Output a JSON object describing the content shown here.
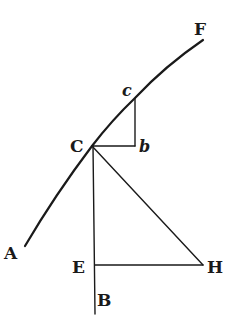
{
  "diagram": {
    "labels": {
      "A": "A",
      "B": "B",
      "C": "C",
      "c": "c",
      "b": "b",
      "E": "E",
      "F": "F",
      "H": "H"
    },
    "elements": [
      {
        "name": "curve-AF",
        "type": "curve",
        "through": [
          "A",
          "C",
          "c",
          "F"
        ]
      },
      {
        "name": "segment-cb",
        "type": "line",
        "from": "c",
        "to": "b"
      },
      {
        "name": "segment-Cb",
        "type": "line",
        "from": "C",
        "to": "b"
      },
      {
        "name": "segment-CB",
        "type": "line",
        "from": "C",
        "to": "B",
        "passes": "E"
      },
      {
        "name": "segment-CH",
        "type": "line",
        "from": "C",
        "to": "H"
      },
      {
        "name": "segment-EH",
        "type": "line",
        "from": "E",
        "to": "H"
      }
    ],
    "colors": {
      "ink": "#1a1a1a",
      "paper": "#ffffff"
    }
  }
}
